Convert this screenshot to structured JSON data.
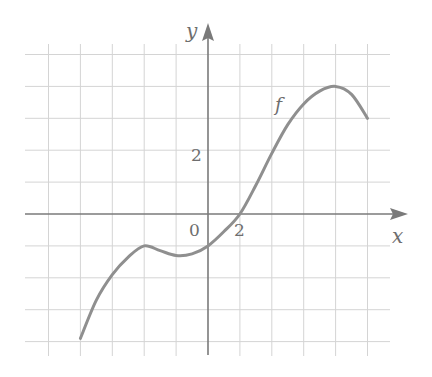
{
  "chart_data": {
    "type": "line",
    "title": "",
    "xlabel": "x",
    "ylabel": "y",
    "series": [
      {
        "name": "f",
        "x": [
          -4,
          -3.5,
          -3,
          -2.5,
          -2,
          -1.5,
          -1,
          -0.5,
          0,
          0.5,
          1,
          1.5,
          2,
          2.5,
          3,
          3.5,
          4,
          4.5,
          5
        ],
        "y": [
          -3.9,
          -2.7,
          -1.9,
          -1.35,
          -1.0,
          -1.15,
          -1.3,
          -1.25,
          -1.0,
          -0.55,
          0.0,
          0.9,
          1.9,
          2.8,
          3.45,
          3.85,
          4.0,
          3.75,
          3.0
        ]
      }
    ],
    "xlim": [
      -5.5,
      6
    ],
    "ylim": [
      -4.5,
      5.5
    ],
    "grid": true,
    "grid_step": 1,
    "tick_labels": {
      "origin": "0",
      "x": [
        {
          "value": 2,
          "label": "2"
        }
      ],
      "y": [
        {
          "value": 2,
          "label": "2"
        }
      ]
    },
    "annotations": [
      {
        "text": "f",
        "x": 2.2,
        "y": 4.2
      }
    ],
    "legend": null
  },
  "labels": {
    "x_axis": "x",
    "y_axis": "y",
    "origin": "0",
    "x_tick_2": "2",
    "y_tick_2": "2",
    "curve_name": "f"
  },
  "colors": {
    "grid": "#d4d4d4",
    "axis": "#7a7a7a",
    "curve": "#8f8f8f",
    "text": "#6e6e6e"
  }
}
